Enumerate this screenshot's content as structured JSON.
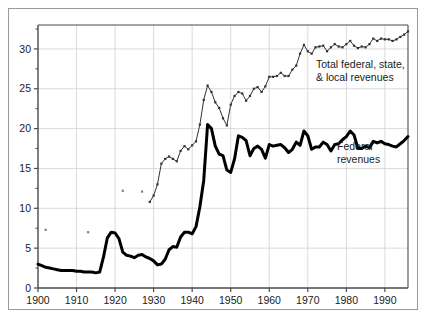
{
  "figure": {
    "background_color": "#ffffff",
    "frame_color": "#9a9a9a"
  },
  "annotations": {
    "total_label_line1": "Total federal, state,",
    "total_label_line2": "& local revenues",
    "federal_label_line1": "Federal",
    "federal_label_line2": "revenues"
  },
  "chart_data": {
    "type": "line",
    "title": "",
    "subtitle": "",
    "xlabel": "",
    "ylabel": "",
    "xlim": [
      1900,
      1996
    ],
    "ylim": [
      0,
      33
    ],
    "xticks": [
      1900,
      1910,
      1920,
      1930,
      1940,
      1950,
      1960,
      1970,
      1980,
      1990
    ],
    "xticklabels": [
      "1900",
      "1910",
      "1920",
      "1930",
      "1940",
      "1950",
      "1960",
      "1970",
      "1980",
      "1990"
    ],
    "yticks": [
      0,
      5,
      10,
      15,
      20,
      25,
      30
    ],
    "yticklabels": [
      "0",
      "5",
      "10",
      "15",
      "20",
      "25",
      "30"
    ],
    "yminorticks": [
      2.5,
      7.5,
      12.5,
      17.5,
      22.5,
      27.5,
      32.5
    ],
    "grid": true,
    "grid_color": "#d0d0d0",
    "legend": "inline-annotations",
    "series": [
      {
        "name": "Total federal, state, & local revenues",
        "color": "#333333",
        "line_width": 1.0,
        "marker": "square-small",
        "x": [
          1929,
          1930,
          1931,
          1932,
          1933,
          1934,
          1935,
          1936,
          1937,
          1938,
          1939,
          1940,
          1941,
          1942,
          1943,
          1944,
          1945,
          1946,
          1947,
          1948,
          1949,
          1950,
          1951,
          1952,
          1953,
          1954,
          1955,
          1956,
          1957,
          1958,
          1959,
          1960,
          1961,
          1962,
          1963,
          1964,
          1965,
          1966,
          1967,
          1968,
          1969,
          1970,
          1971,
          1972,
          1973,
          1974,
          1975,
          1976,
          1977,
          1978,
          1979,
          1980,
          1981,
          1982,
          1983,
          1984,
          1985,
          1986,
          1987,
          1988,
          1989,
          1990,
          1991,
          1992,
          1993,
          1994,
          1995,
          1996
        ],
        "y": [
          10.8,
          11.6,
          13.0,
          15.6,
          16.2,
          16.5,
          16.2,
          15.9,
          17.2,
          17.8,
          17.4,
          17.9,
          18.4,
          20.5,
          23.6,
          25.4,
          24.6,
          23.3,
          22.6,
          21.3,
          20.4,
          23.0,
          24.1,
          24.6,
          24.4,
          23.5,
          24.1,
          25.0,
          25.2,
          24.6,
          25.3,
          26.5,
          26.5,
          26.6,
          27.0,
          26.6,
          26.6,
          27.4,
          27.9,
          29.4,
          30.5,
          29.7,
          29.4,
          30.2,
          30.3,
          30.4,
          29.7,
          30.2,
          30.6,
          30.3,
          30.2,
          30.6,
          31.0,
          30.4,
          30.1,
          30.3,
          30.2,
          30.6,
          31.3,
          31.0,
          31.3,
          31.2,
          31.2,
          31.0,
          31.2,
          31.5,
          31.8,
          32.2
        ]
      },
      {
        "name": "Federal revenues",
        "color": "#000000",
        "line_width": 3.0,
        "marker": "none",
        "x": [
          1900,
          1901,
          1902,
          1903,
          1904,
          1905,
          1906,
          1907,
          1908,
          1909,
          1910,
          1911,
          1912,
          1913,
          1914,
          1915,
          1916,
          1917,
          1918,
          1919,
          1920,
          1921,
          1922,
          1923,
          1924,
          1925,
          1926,
          1927,
          1928,
          1929,
          1930,
          1931,
          1932,
          1933,
          1934,
          1935,
          1936,
          1937,
          1938,
          1939,
          1940,
          1941,
          1942,
          1943,
          1944,
          1945,
          1946,
          1947,
          1948,
          1949,
          1950,
          1951,
          1952,
          1953,
          1954,
          1955,
          1956,
          1957,
          1958,
          1959,
          1960,
          1961,
          1962,
          1963,
          1964,
          1965,
          1966,
          1967,
          1968,
          1969,
          1970,
          1971,
          1972,
          1973,
          1974,
          1975,
          1976,
          1977,
          1978,
          1979,
          1980,
          1981,
          1982,
          1983,
          1984,
          1985,
          1986,
          1987,
          1988,
          1989,
          1990,
          1991,
          1992,
          1993,
          1994,
          1995,
          1996
        ],
        "y": [
          3.0,
          2.8,
          2.6,
          2.5,
          2.4,
          2.3,
          2.2,
          2.2,
          2.2,
          2.2,
          2.1,
          2.1,
          2.0,
          2.0,
          2.0,
          1.9,
          2.0,
          3.9,
          6.3,
          7.0,
          6.9,
          6.2,
          4.5,
          4.1,
          4.0,
          3.8,
          4.1,
          4.2,
          3.9,
          3.7,
          3.4,
          2.9,
          3.0,
          3.6,
          4.8,
          5.2,
          5.1,
          6.4,
          7.0,
          7.0,
          6.8,
          7.7,
          10.2,
          13.5,
          20.5,
          20.0,
          17.8,
          16.8,
          16.6,
          14.8,
          14.5,
          16.2,
          19.1,
          18.9,
          18.5,
          16.6,
          17.5,
          17.8,
          17.4,
          16.3,
          18.0,
          17.8,
          17.9,
          18.0,
          17.6,
          17.0,
          17.4,
          18.3,
          17.9,
          19.7,
          19.1,
          17.4,
          17.7,
          17.7,
          18.3,
          18.0,
          17.2,
          18.0,
          18.1,
          18.6,
          19.0,
          19.7,
          19.2,
          17.5,
          17.5,
          17.8,
          17.6,
          18.4,
          18.2,
          18.4,
          18.1,
          18.0,
          17.8,
          17.7,
          18.1,
          18.5,
          19.0
        ]
      },
      {
        "name": "Total revenues sparse historical points",
        "color": "#808080",
        "line_width": 0,
        "marker": "square-small",
        "x": [
          1902,
          1913,
          1922,
          1927
        ],
        "y": [
          7.3,
          7.0,
          12.2,
          12.1
        ]
      }
    ]
  }
}
